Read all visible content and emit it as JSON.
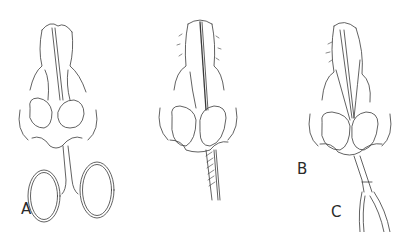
{
  "figure": {
    "panels": [
      {
        "id": "A",
        "label": "A",
        "instrument": "scissors"
      },
      {
        "id": "B",
        "label": "B",
        "instrument": "hatched-blade"
      },
      {
        "id": "C",
        "label": "C",
        "instrument": "elevator-handle"
      }
    ]
  },
  "colors": {
    "line": "#3a3a3a",
    "background": "#ffffff"
  }
}
